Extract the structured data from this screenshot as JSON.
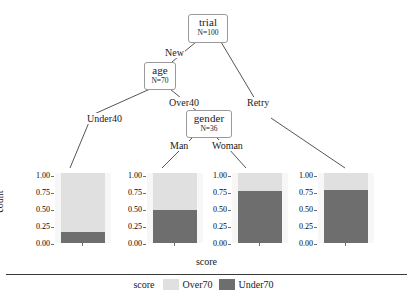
{
  "chart_data": {
    "type": "bar",
    "title": "",
    "xlabel": "score",
    "ylabel": "count",
    "ylim": [
      0,
      1
    ],
    "ytick_labels": [
      "0.00",
      "0.25",
      "0.50",
      "0.75",
      "1.00"
    ],
    "legend_title": "score",
    "legend": [
      {
        "name": "Over70",
        "color": "#e0e0e0"
      },
      {
        "name": "Under70",
        "color": "#6e6e6e"
      }
    ],
    "stacked": true,
    "panels": [
      {
        "path": "New / Under40",
        "values": {
          "Under70": 0.16,
          "Over70": 0.84
        }
      },
      {
        "path": "New / Over40 / Man",
        "values": {
          "Under70": 0.47,
          "Over70": 0.53
        }
      },
      {
        "path": "New / Over40 / Woman",
        "values": {
          "Under70": 0.75,
          "Over70": 0.25
        }
      },
      {
        "path": "Retry",
        "values": {
          "Under70": 0.76,
          "Over70": 0.24
        }
      }
    ]
  },
  "tree": {
    "nodes": [
      {
        "id": "trial",
        "label": "trial",
        "sub": "N=100"
      },
      {
        "id": "age",
        "label": "age",
        "sub": "N=70"
      },
      {
        "id": "gender",
        "label": "gender",
        "sub": "N=36"
      }
    ],
    "edge_labels": [
      {
        "id": "new",
        "text": "New"
      },
      {
        "id": "retry",
        "text": "Retry"
      },
      {
        "id": "under40",
        "text": "Under40"
      },
      {
        "id": "over40",
        "text": "Over40"
      },
      {
        "id": "man",
        "text": "Man"
      },
      {
        "id": "woman",
        "text": "Woman"
      }
    ]
  },
  "axis": {
    "ylabel": "count",
    "xlabel": "score",
    "ticks": [
      "1.00",
      "0.75",
      "0.50",
      "0.25",
      "0.00"
    ]
  },
  "legend": {
    "title": "score",
    "item1": "Over70",
    "item2": "Under70"
  }
}
